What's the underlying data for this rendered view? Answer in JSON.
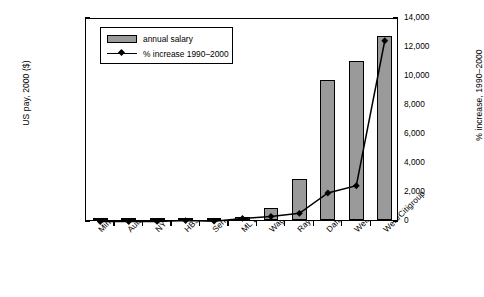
{
  "chart_data": {
    "type": "bar",
    "title": "",
    "categories": [
      "Min wage",
      "Auto worker",
      "NY Teacher",
      "HBS MBA",
      "Senior Pilot",
      "ML Baseball",
      "Wagoner/GM",
      "Raymond/Exxon",
      "Daft/Coke",
      "Welch/GE",
      "Weill/Citigroup"
    ],
    "series": [
      {
        "name": "annual salary",
        "type": "bar",
        "axis": "left",
        "values": [
          10700,
          55000,
          52000,
          120000,
          250000,
          2000000,
          9500000,
          32000000,
          110000000,
          125000000,
          145000000
        ]
      },
      {
        "name": "% increase 1990-2000",
        "type": "line",
        "axis": "right",
        "values": [
          30,
          35,
          40,
          100,
          60,
          250,
          380,
          600,
          2000,
          2500,
          12500
        ]
      }
    ],
    "xlabel": "",
    "ylabel": "US pay, 2000 ($)",
    "ylabel_right": "% increase, 1990–2000",
    "ylim": [
      0,
      160000000
    ],
    "ylim_right": [
      0,
      14000
    ],
    "yticks": [
      "0",
      "20,000,000",
      "40,000,000",
      "60,000,000",
      "80,000,000",
      "100,000,000",
      "120,000,000",
      "140,000,000",
      "160,000,000"
    ],
    "ytick_values": [
      0,
      20000000,
      40000000,
      60000000,
      80000000,
      100000000,
      120000000,
      140000000,
      160000000
    ],
    "yticks_right": [
      "0",
      "2,000",
      "4,000",
      "6,000",
      "8,000",
      "10,000",
      "12,000",
      "14,000"
    ],
    "ytick_values_right": [
      0,
      2000,
      4000,
      6000,
      8000,
      10000,
      12000,
      14000
    ],
    "grid": false,
    "legend_position": "upper-left",
    "bar_color": "#9a9a9a",
    "line_color": "#000000",
    "marker": "diamond"
  },
  "legend": {
    "items": [
      {
        "label": "annual salary"
      },
      {
        "label": "% increase 1990–2000"
      }
    ]
  }
}
